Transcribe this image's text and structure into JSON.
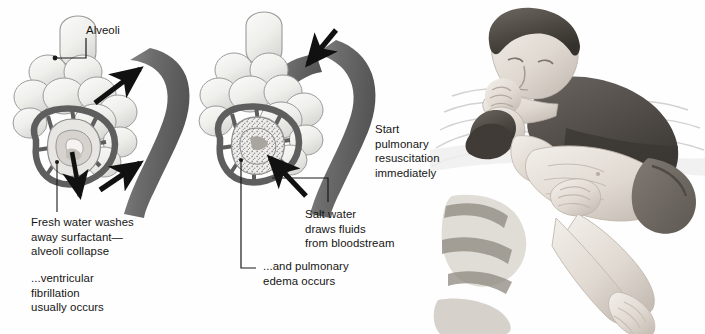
{
  "figure": {
    "width": 705,
    "height": 334,
    "background_color": "#fefefe"
  },
  "palette": {
    "text": "#151515",
    "leader_line": "#1a1a1a",
    "arrow_black": "#111111",
    "vessel_dark": "#6e6e6e",
    "vessel_darker": "#565656",
    "alveoli_fill": "#f2f2f0",
    "alveoli_outline": "#8d8d8d",
    "edema_stipple": "#9a9a9a",
    "skin_light": "#ebe7e2",
    "skin_shadow": "#c9c2ba",
    "hair_dark": "#4a4641",
    "shirt_dark": "#55514c",
    "water_line": "#cfcfcf",
    "shorts_dark": "#6b6660"
  },
  "panels": [
    {
      "id": "panel-fresh-water",
      "name": "fresh-water-alveoli-panel",
      "description": "Cross-section of alveolar cluster with capillary network; fresh water aspirated; arrows point from alveolus up into the pulmonary vessel showing water moving into the bloodstream",
      "arrow_direction": "into-bloodstream",
      "arrow_count": 2
    },
    {
      "id": "panel-salt-water",
      "name": "salt-water-alveoli-panel",
      "description": "Cross-section of alveolar cluster filled with stippled fluid (pulmonary edema); arrow points from vessel down into alveolus showing fluid drawn out of the bloodstream",
      "arrow_direction": "into-alveolus",
      "arrow_count": 2
    },
    {
      "id": "panel-rescue",
      "name": "in-water-rescue-breathing-panel",
      "description": "Pencil illustration of a rescuer in water performing mouth-to-mouth rescue breathing on a supine victim while supporting the head and pinching the nose"
    }
  ],
  "labels": {
    "alveoli": "Alveoli",
    "fresh_water": "Fresh water washes\naway surfactant—\nalveoli collapse",
    "ventricular": "...ventricular\nfibrillation\nusually occurs",
    "salt_water": "Salt water\ndraws fluids\nfrom bloodstream",
    "pulmonary_edema": "...and pulmonary\nedema occurs",
    "start_resuscitation": "Start\npulmonary\nresuscitation\nimmediately"
  },
  "leader_lines": [
    {
      "name": "alveoli-leader",
      "description": "L-shaped line from the Alveoli text down and left to a dot on an alveolus"
    },
    {
      "name": "fresh-water-leader",
      "description": "Vertical line from the fresh-water alveolus cross-section down to the Fresh water caption"
    },
    {
      "name": "salt-water-leader",
      "description": "Horizontal line right from the salt-water alveolus bending down to the Salt water caption"
    },
    {
      "name": "pulmonary-edema-leader",
      "description": "Long vertical line from the salt-water alveolus down and right to the pulmonary edema caption"
    }
  ]
}
